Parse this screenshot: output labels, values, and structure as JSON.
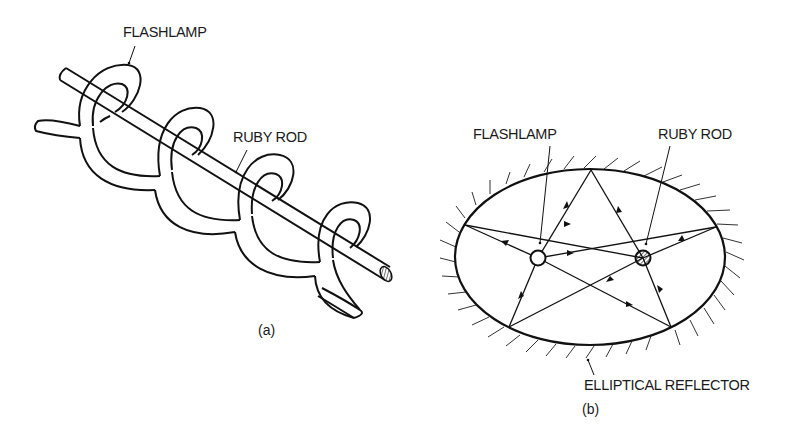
{
  "figure_a": {
    "caption": "(a)",
    "labels": {
      "flashlamp": "FLASHLAMP",
      "ruby_rod": "RUBY ROD"
    },
    "description": "Helical flashlamp coiled around a ruby rod"
  },
  "figure_b": {
    "caption": "(b)",
    "labels": {
      "flashlamp": "FLASHLAMP",
      "ruby_rod": "RUBY ROD",
      "reflector": "ELLIPTICAL REFLECTOR"
    },
    "description": "Cross-section of elliptical reflector with flashlamp and ruby rod at the foci; light rays reflect from the walls forming a star pattern"
  },
  "colors": {
    "line": "#111111",
    "background": "#ffffff"
  }
}
